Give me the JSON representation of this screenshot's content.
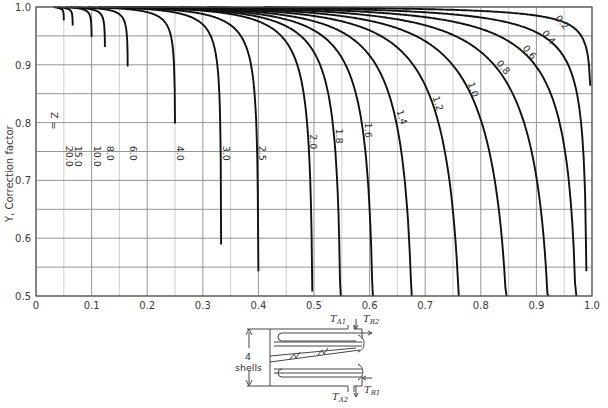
{
  "chart_data": {
    "type": "line",
    "title": "",
    "xlabel": "",
    "ylabel": "Y, Correction factor",
    "xlim": [
      0,
      1.0
    ],
    "ylim": [
      0.5,
      1.0
    ],
    "x_ticks": [
      "0",
      "0.1",
      "0.2",
      "0.3",
      "0.4",
      "0.5",
      "0.6",
      "0.7",
      "0.8",
      "0.9",
      "1.0"
    ],
    "y_ticks": [
      "0.5",
      "0.6",
      "0.7",
      "0.8",
      "0.9",
      "1.0"
    ],
    "grid": true,
    "parameter_name": "Z",
    "shell_passes": 4,
    "series": [
      {
        "name": "Z = 20.0",
        "label": "20.0",
        "Z": 20.0,
        "x_at_y_0_5": 0.05
      },
      {
        "name": "15.0",
        "label": "15.0",
        "Z": 15.0,
        "x_at_y_0_5": 0.066
      },
      {
        "name": "10.0",
        "label": "10.0",
        "Z": 10.0,
        "x_at_y_0_5": 0.1
      },
      {
        "name": "8.0",
        "label": "8.0",
        "Z": 8.0,
        "x_at_y_0_5": 0.124
      },
      {
        "name": "6.0",
        "label": "6.0",
        "Z": 6.0,
        "x_at_y_0_5": 0.165
      },
      {
        "name": "4.0",
        "label": "4.0",
        "Z": 4.0,
        "x_at_y_0_5": 0.25
      },
      {
        "name": "3.0",
        "label": "3.0",
        "Z": 3.0,
        "x_at_y_0_5": 0.333
      },
      {
        "name": "2.5",
        "label": "2.5",
        "Z": 2.5,
        "x_at_y_0_5": 0.4
      },
      {
        "name": "2.0",
        "label": "2.0",
        "Z": 2.0,
        "x_at_y_0_5": 0.497
      },
      {
        "name": "1.8",
        "label": "1.8",
        "Z": 1.8,
        "x_at_y_0_5": 0.547
      },
      {
        "name": "1.6",
        "label": "1.6",
        "Z": 1.6,
        "x_at_y_0_5": 0.605
      },
      {
        "name": "1.4",
        "label": "1.4",
        "Z": 1.4,
        "x_at_y_0_5": 0.675
      },
      {
        "name": "1.2",
        "label": "1.2",
        "Z": 1.2,
        "x_at_y_0_5": 0.76
      },
      {
        "name": "1.0",
        "label": "1.0",
        "Z": 1.0,
        "x_at_y_0_5": 0.845
      },
      {
        "name": "0.8",
        "label": "0.8",
        "Z": 0.8,
        "x_at_y_0_5": 0.92
      },
      {
        "name": "0.6",
        "label": "0.6",
        "Z": 0.6,
        "x_at_y_0_5": 0.97
      },
      {
        "name": "0.4",
        "label": "0.4",
        "Z": 0.4,
        "x_at_y_0_5": 0.99
      },
      {
        "name": "0.2",
        "label": "0.2",
        "Z": 0.2,
        "x_at_y_0_5": 0.997
      }
    ],
    "annotations": [
      "Z = 20.0"
    ]
  },
  "inset": {
    "shells_count": "4",
    "shells_label": "shells",
    "labels": {
      "ta1": "A1",
      "tb2": "B2",
      "ta2": "A2",
      "tb1": "B1",
      "t": "T"
    }
  }
}
